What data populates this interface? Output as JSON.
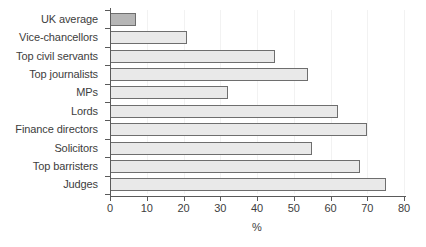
{
  "chart_data": {
    "type": "bar",
    "orientation": "horizontal",
    "title": "",
    "subtitle": "",
    "xlabel": "%",
    "ylabel": "",
    "xlim": [
      0,
      80
    ],
    "xticks": [
      0,
      10,
      20,
      30,
      40,
      50,
      60,
      70,
      80
    ],
    "xtick_labels": [
      "0",
      "10",
      "20",
      "30",
      "40",
      "50",
      "60",
      "70",
      "80"
    ],
    "grid": true,
    "grid_axis": "x",
    "legend": false,
    "legend_position": "none",
    "categories": [
      "UK average",
      "Vice-chancellors",
      "Top civil servants",
      "Top journalists",
      "MPs",
      "Lords",
      "Finance directors",
      "Solicitors",
      "Top barristers",
      "Judges"
    ],
    "values": [
      7,
      21,
      45,
      54,
      32,
      62,
      70,
      55,
      68,
      75
    ],
    "highlight_index": 0,
    "series": [
      {
        "name": "Privately educated",
        "values": [
          7,
          21,
          45,
          54,
          32,
          62,
          70,
          55,
          68,
          75
        ]
      }
    ],
    "colors": {
      "bar_fill": "#e9e9e9",
      "bar_highlight_fill": "#b6b6b6",
      "bar_edge": "#6e6e6e",
      "axis": "#5a5a5a",
      "grid": "#f2f2f2",
      "text": "#3d3d3d",
      "background": "#ffffff"
    }
  }
}
